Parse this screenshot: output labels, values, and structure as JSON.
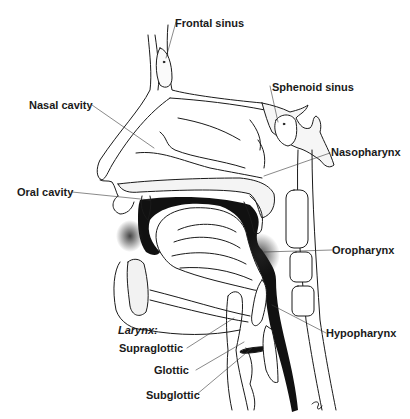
{
  "diagram": {
    "labels": {
      "frontal_sinus": "Frontal sinus",
      "sphenoid_sinus": "Sphenoid sinus",
      "nasal_cavity": "Nasal cavity",
      "nasopharynx": "Nasopharynx",
      "oral_cavity": "Oral cavity",
      "oropharynx": "Oropharynx",
      "hypopharynx": "Hypopharynx",
      "larynx_heading": "Larynx:",
      "supraglottic": "Supraglottic",
      "glottic": "Glottic",
      "subglottic": "Subglottic"
    },
    "colors": {
      "line": "#1a1a1a",
      "airway_fill": "#111111",
      "bone_fill": "#f4f4f4",
      "background": "#ffffff"
    }
  }
}
